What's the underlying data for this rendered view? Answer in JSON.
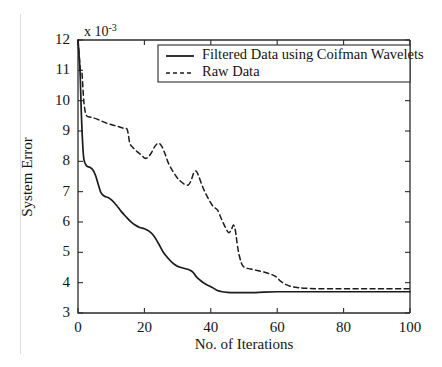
{
  "chart_data": {
    "type": "line",
    "title": "",
    "xlabel": "No. of Iterations",
    "ylabel": "System Error",
    "y_exponent_prefix": "x 10",
    "y_exponent_power": "-3",
    "y_scale_note": "values in units of 1e-3",
    "xlim": [
      0,
      100
    ],
    "ylim": [
      3,
      12
    ],
    "xticks": [
      0,
      20,
      40,
      60,
      80,
      100
    ],
    "yticks": [
      3,
      4,
      5,
      6,
      7,
      8,
      9,
      10,
      11,
      12
    ],
    "xticklabels": [
      "0",
      "20",
      "40",
      "60",
      "80",
      "100"
    ],
    "yticklabels": [
      "3",
      "4",
      "5",
      "6",
      "7",
      "8",
      "9",
      "10",
      "11",
      "12"
    ],
    "grid": false,
    "legend_position": "upper right",
    "series": [
      {
        "name": "Filtered Data using Coifman Wavelets",
        "style": "solid",
        "color": "#1c1c1c",
        "points": [
          [
            0,
            12.0
          ],
          [
            0.6,
            11.0
          ],
          [
            1.0,
            9.6
          ],
          [
            1.4,
            8.6
          ],
          [
            1.8,
            8.05
          ],
          [
            2.6,
            7.85
          ],
          [
            3.6,
            7.8
          ],
          [
            4.6,
            7.7
          ],
          [
            5.4,
            7.5
          ],
          [
            6.2,
            7.2
          ],
          [
            7.0,
            6.95
          ],
          [
            8.0,
            6.85
          ],
          [
            9.2,
            6.8
          ],
          [
            10.4,
            6.7
          ],
          [
            11.6,
            6.55
          ],
          [
            13.0,
            6.35
          ],
          [
            14.4,
            6.18
          ],
          [
            15.8,
            6.02
          ],
          [
            17.2,
            5.9
          ],
          [
            18.6,
            5.82
          ],
          [
            20.0,
            5.78
          ],
          [
            21.4,
            5.7
          ],
          [
            22.8,
            5.55
          ],
          [
            24.2,
            5.3
          ],
          [
            25.6,
            5.02
          ],
          [
            27.0,
            4.82
          ],
          [
            28.4,
            4.66
          ],
          [
            29.8,
            4.55
          ],
          [
            31.0,
            4.5
          ],
          [
            32.4,
            4.46
          ],
          [
            33.6,
            4.42
          ],
          [
            34.6,
            4.35
          ],
          [
            35.6,
            4.2
          ],
          [
            36.8,
            4.08
          ],
          [
            38.0,
            3.98
          ],
          [
            39.4,
            3.9
          ],
          [
            40.8,
            3.82
          ],
          [
            42.0,
            3.74
          ],
          [
            43.4,
            3.7
          ],
          [
            45.0,
            3.68
          ],
          [
            47.0,
            3.67
          ],
          [
            50.0,
            3.67
          ],
          [
            53.0,
            3.67
          ],
          [
            56.0,
            3.69
          ],
          [
            60.0,
            3.7
          ],
          [
            65.0,
            3.7
          ],
          [
            70.0,
            3.7
          ],
          [
            80.0,
            3.7
          ],
          [
            90.0,
            3.7
          ],
          [
            100.0,
            3.7
          ]
        ]
      },
      {
        "name": "Raw Data",
        "style": "dashed",
        "color": "#1c1c1c",
        "points": [
          [
            0,
            12.0
          ],
          [
            0.7,
            11.05
          ],
          [
            1.2,
            10.9
          ],
          [
            1.6,
            10.2
          ],
          [
            2.0,
            9.75
          ],
          [
            2.6,
            9.5
          ],
          [
            4.0,
            9.45
          ],
          [
            5.6,
            9.4
          ],
          [
            7.2,
            9.32
          ],
          [
            8.8,
            9.25
          ],
          [
            10.4,
            9.2
          ],
          [
            12.0,
            9.15
          ],
          [
            13.4,
            9.1
          ],
          [
            14.8,
            9.05
          ],
          [
            15.6,
            8.6
          ],
          [
            16.6,
            8.45
          ],
          [
            17.8,
            8.32
          ],
          [
            19.0,
            8.22
          ],
          [
            20.2,
            8.1
          ],
          [
            21.2,
            8.15
          ],
          [
            22.2,
            8.3
          ],
          [
            23.2,
            8.5
          ],
          [
            24.2,
            8.6
          ],
          [
            25.2,
            8.5
          ],
          [
            26.2,
            8.25
          ],
          [
            27.2,
            7.95
          ],
          [
            28.4,
            7.7
          ],
          [
            29.6,
            7.5
          ],
          [
            30.8,
            7.35
          ],
          [
            32.0,
            7.25
          ],
          [
            33.2,
            7.22
          ],
          [
            34.0,
            7.35
          ],
          [
            34.8,
            7.6
          ],
          [
            35.6,
            7.68
          ],
          [
            36.4,
            7.5
          ],
          [
            37.4,
            7.2
          ],
          [
            38.4,
            6.95
          ],
          [
            39.6,
            6.7
          ],
          [
            40.8,
            6.5
          ],
          [
            42.0,
            6.4
          ],
          [
            43.2,
            6.1
          ],
          [
            44.4,
            5.82
          ],
          [
            45.4,
            5.65
          ],
          [
            46.2,
            5.75
          ],
          [
            46.8,
            5.9
          ],
          [
            47.4,
            5.72
          ],
          [
            48.2,
            5.1
          ],
          [
            49.2,
            4.65
          ],
          [
            50.2,
            4.5
          ],
          [
            52.0,
            4.45
          ],
          [
            54.0,
            4.4
          ],
          [
            56.0,
            4.35
          ],
          [
            58.0,
            4.28
          ],
          [
            59.6,
            4.2
          ],
          [
            61.0,
            4.05
          ],
          [
            62.4,
            3.95
          ],
          [
            64.0,
            3.88
          ],
          [
            66.0,
            3.84
          ],
          [
            68.0,
            3.82
          ],
          [
            72.0,
            3.8
          ],
          [
            78.0,
            3.8
          ],
          [
            85.0,
            3.8
          ],
          [
            92.0,
            3.8
          ],
          [
            100.0,
            3.8
          ]
        ]
      }
    ]
  },
  "legend": {
    "entries": [
      {
        "label": "Filtered Data using Coifman Wavelets",
        "style": "solid"
      },
      {
        "label": "Raw Data",
        "style": "dashed"
      }
    ]
  }
}
